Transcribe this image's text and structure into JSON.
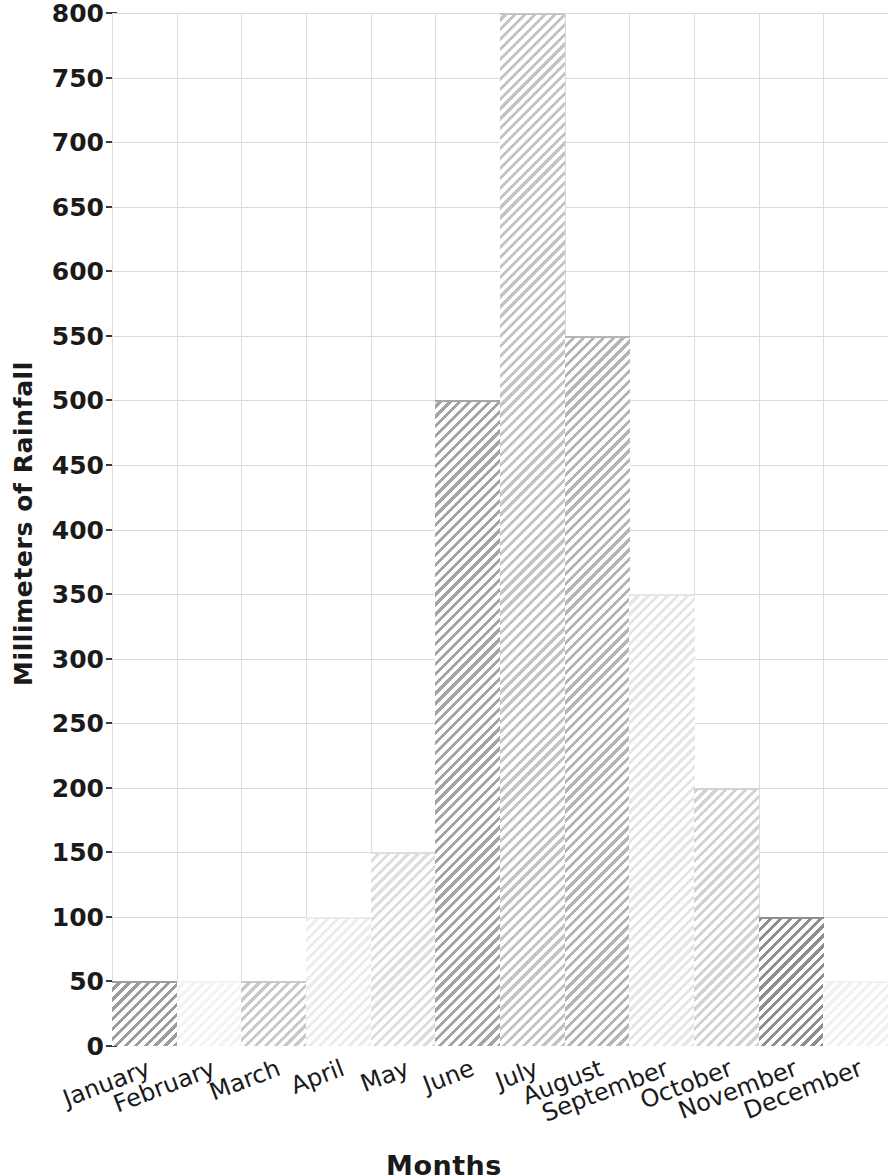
{
  "chart_data": {
    "type": "bar",
    "title": "",
    "xlabel": "Months",
    "ylabel": "Millimeters of Rainfall",
    "categories": [
      "January",
      "February",
      "March",
      "April",
      "May",
      "June",
      "July",
      "August",
      "September",
      "October",
      "November",
      "December"
    ],
    "values": [
      50,
      50,
      50,
      100,
      150,
      500,
      800,
      550,
      350,
      200,
      100,
      50
    ],
    "ylim": [
      0,
      800
    ],
    "yticks": [
      0,
      50,
      100,
      150,
      200,
      250,
      300,
      350,
      400,
      450,
      500,
      550,
      600,
      650,
      700,
      750,
      800
    ],
    "ytick_labels": [
      "0",
      "50",
      "100",
      "150",
      "200",
      "250",
      "300",
      "350",
      "400",
      "450",
      "500",
      "550",
      "600",
      "650",
      "700",
      "750",
      "800"
    ],
    "grid": true,
    "legend": false,
    "style": "hand-drawn-sketch",
    "bar_fill_colors": [
      "#9d9d9d",
      "#f3f3f3",
      "#c9c9c9",
      "#ececec",
      "#dedede",
      "#a5a5a5",
      "#c4c4c4",
      "#b5b5b5",
      "#e6e6e6",
      "#d2d2d2",
      "#8e8e8e",
      "#f1f1f1"
    ],
    "hatch": "diagonal-lines",
    "bar_edges_continuous": true
  },
  "axes": {
    "grid_color": "#d9d9d9",
    "tick_color": "#3a3a3a",
    "text_color": "#1a1a1a",
    "background": "#ffffff"
  }
}
